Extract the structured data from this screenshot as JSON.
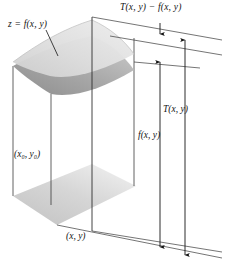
{
  "figure": {
    "type": "3d-surface-tangent-plane-diagram",
    "background_color": "#ffffff",
    "ink_color": "#141414",
    "surface_fill_light": "#d7d7d7",
    "surface_fill_dark": "#9a9a9a",
    "base_fill": "#d2d2d2",
    "labels": {
      "tangent_minus_function": "T(x, y) − f(x, y)",
      "surface_equation": "z = f(x, y)",
      "tangent_value": "T(x, y)",
      "function_value": "f(x, y)",
      "base_point": "(x₀, y₀)",
      "evaluation_point": "(x, y)"
    },
    "parts": {
      "curved_surface": "graph of z = f(x, y)",
      "tangent_plane": "tangent plane T(x, y) at (x₀, y₀)",
      "base_plane": "xy-plane domain patch",
      "vertical_axis_line": "vertical line through (x, y)",
      "measure_tf": "double arrow for T(x, y) − f(x, y)",
      "measure_f": "double arrow for f(x, y)",
      "measure_T": "double arrow for T(x, y)",
      "leader_line": "pointer from z = f(x, y) label to surface"
    }
  }
}
